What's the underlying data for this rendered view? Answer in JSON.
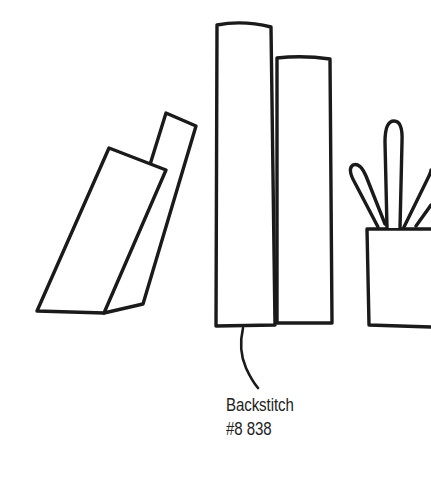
{
  "artwork": {
    "title": "Backstitch stitch sample illustration",
    "background_color": "#ffffff",
    "ink_color": "#1a1a1a",
    "description": "Line drawing of four books on a shelf with a potted plant, annotated with a leader line"
  },
  "annotation": {
    "stitch_name": "Backstitch",
    "thread_code": "#8 838",
    "leader_line": "curved-leader-line"
  },
  "objects": {
    "tilted_book_back": "tilted-book-back",
    "tilted_book_front": "tilted-book-front",
    "upright_book_tall": "upright-book-tall",
    "upright_book_short": "upright-book-short",
    "plant_pot": "plant-pot",
    "leaf_left": "leaf-left",
    "leaf_center": "leaf-center",
    "leaf_right_inner": "leaf-right-inner",
    "leaf_right_outer": "leaf-right-outer"
  }
}
